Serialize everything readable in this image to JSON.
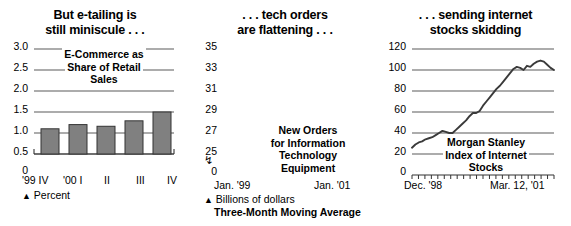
{
  "figure": {
    "panels": [
      {
        "id": "etailing",
        "title_lines": [
          "But e-tailing is",
          "still miniscule . . ."
        ],
        "annotation_lines": [
          "E-Commerce as",
          "Share of Retail",
          "Sales"
        ],
        "footnote_marker": "▲",
        "footnote": "Percent",
        "footnote2": ""
      },
      {
        "id": "tech-orders",
        "title_lines": [
          ". . . tech orders",
          "are flattening . . ."
        ],
        "annotation_lines": [
          "New Orders",
          "for Information",
          "Technology",
          "Equipment"
        ],
        "footnote_marker": "▲",
        "footnote": "Billions of dollars",
        "footnote2": "Three-Month Moving Average"
      },
      {
        "id": "internet-stocks",
        "title_lines": [
          ". . . sending internet",
          "stocks skidding"
        ],
        "annotation_lines": [
          "Morgan Stanley",
          "Index of Internet",
          "Stocks"
        ],
        "footnote_marker": "",
        "footnote": "",
        "footnote2": ""
      }
    ]
  },
  "chart_data": [
    {
      "type": "bar",
      "title": "But e-tailing is still miniscule . . .",
      "subtitle": "E-Commerce as Share of Retail Sales",
      "xlabel": "",
      "ylabel": "Percent",
      "categories": [
        "'99 IV",
        "'00 I",
        "II",
        "III",
        "IV"
      ],
      "values": [
        0.6,
        0.7,
        0.66,
        0.79,
        1.0
      ],
      "ytick_labels": [
        "3.0",
        "2.5",
        "2.0",
        "1.5",
        "1.0",
        "0.5",
        "0"
      ],
      "yticks": [
        3.0,
        2.5,
        2.0,
        1.5,
        1.0,
        0.5,
        0
      ],
      "ylim": [
        0,
        3.0
      ],
      "grid": true,
      "legend": "none",
      "bar_color": "#808080",
      "bar_edge_color": "#333333"
    },
    {
      "type": "line",
      "title": ". . . tech orders are flattening . . .",
      "subtitle": "New Orders for Information Technology Equipment",
      "xlabel": "",
      "ylabel": "Billions of dollars",
      "note": "Three-Month Moving Average",
      "x_axis_start_label": "Jan. '99",
      "x_axis_end_label": "Jan. '01",
      "ytick_labels": [
        "35",
        "33",
        "31",
        "29",
        "27",
        "25",
        "0"
      ],
      "yticks": [
        35,
        33,
        31,
        29,
        27,
        25,
        0
      ],
      "ylim": [
        25,
        35
      ],
      "axis_break": true,
      "grid": true,
      "legend": "none",
      "line_color": "#3a3a3a",
      "values": [
        25.6,
        25.9,
        26.1,
        26.2,
        26.4,
        26.5,
        26.6,
        26.8,
        27.0,
        27.2,
        27.1,
        27.0,
        27.0,
        27.3,
        27.6,
        27.9,
        28.2,
        28.6,
        28.9,
        28.9,
        29.1,
        29.6,
        30.0,
        30.4,
        30.8,
        31.2,
        31.5,
        31.9,
        32.3,
        32.7,
        33.1,
        33.3,
        33.2,
        33.0,
        33.4,
        33.3,
        33.6,
        33.8,
        33.9,
        33.8,
        33.5,
        33.2,
        33.0
      ]
    },
    {
      "type": "line",
      "title": ". . . sending internet stocks skidding",
      "subtitle": "Morgan Stanley Index of Internet Stocks",
      "xlabel": "",
      "ylabel": "",
      "x_axis_start_label": "Dec. '98",
      "x_axis_end_label": "Mar. 12, '01",
      "ytick_labels": [
        "120",
        "100",
        "80",
        "60",
        "40",
        "20",
        "0"
      ],
      "yticks": [
        120,
        100,
        80,
        60,
        40,
        20,
        0
      ],
      "ylim": [
        0,
        120
      ],
      "grid": true,
      "legend": "none",
      "line_color": "#3a3a3a",
      "values": [
        20,
        30,
        29,
        28,
        33,
        33,
        46,
        40,
        39,
        46,
        40,
        39,
        40,
        41,
        47,
        56,
        70,
        86,
        99,
        98,
        99,
        106,
        113,
        103,
        96,
        88,
        80,
        72,
        68,
        71,
        75,
        70,
        73,
        78,
        72,
        62,
        50,
        40,
        34,
        30,
        28,
        31,
        26,
        22,
        17
      ]
    }
  ]
}
